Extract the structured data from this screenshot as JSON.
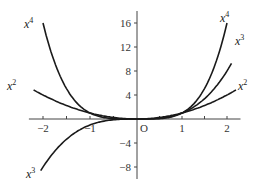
{
  "chart_data": {
    "type": "line",
    "title": "",
    "xlabel": "",
    "ylabel": "",
    "origin_label": "O",
    "xlim": [
      -2.3,
      2.3
    ],
    "ylim": [
      -10,
      18
    ],
    "grid": false,
    "legend": "inline labels at curve ends",
    "x_ticks": [
      -2,
      -1,
      1,
      2
    ],
    "x_tick_labels": [
      "−2",
      "−1",
      "1",
      "2"
    ],
    "x_minor_ticks": [
      -1.5,
      -0.5,
      0.5,
      1.5
    ],
    "y_ticks": [
      16,
      12,
      8,
      4,
      -4,
      -8
    ],
    "y_tick_labels": [
      "16",
      "12",
      "8",
      "4",
      "−4",
      "−8"
    ],
    "series": [
      {
        "name": "x^2",
        "label_base": "x",
        "label_exp": "2",
        "exponent": 2,
        "domain": [
          -2.2,
          2.2
        ]
      },
      {
        "name": "x^3",
        "label_base": "x",
        "label_exp": "3",
        "exponent": 3,
        "domain": [
          -2.05,
          2.1
        ]
      },
      {
        "name": "x^4",
        "label_base": "x",
        "label_exp": "4",
        "exponent": 4,
        "domain": [
          -2.0,
          2.0
        ]
      }
    ],
    "labels": [
      {
        "series": "x^4",
        "side": "left",
        "x": 24,
        "y": 28
      },
      {
        "series": "x^2",
        "side": "left",
        "x": 7,
        "y": 90
      },
      {
        "series": "x^3",
        "side": "left",
        "x": 26,
        "y": 178
      },
      {
        "series": "x^4",
        "side": "right",
        "x": 220,
        "y": 22
      },
      {
        "series": "x^3",
        "side": "right",
        "x": 235,
        "y": 45
      },
      {
        "series": "x^2",
        "side": "right",
        "x": 238,
        "y": 90
      }
    ]
  },
  "layout": {
    "origin_px": [
      137,
      119
    ],
    "x_px_per_unit_left": 47,
    "x_px_per_unit_right": 45,
    "y_px_per_unit": 6.0
  }
}
